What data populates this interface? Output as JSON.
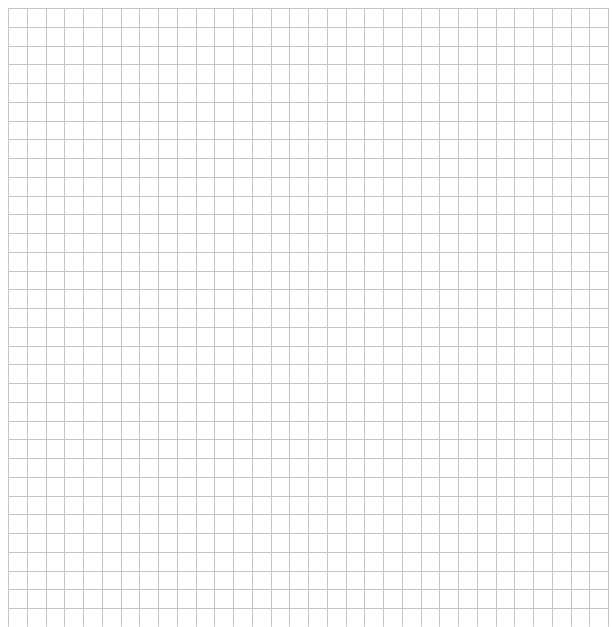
{
  "grid": {
    "origin_x": 8,
    "origin_y": 8,
    "cell_size": 18.75,
    "columns": 32,
    "rows": 33,
    "line_color": "#c4c4c4",
    "background": "#ffffff"
  }
}
